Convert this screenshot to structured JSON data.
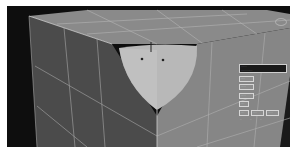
{
  "app": {
    "type": "3D modeling viewport",
    "view": "perspective"
  },
  "scene": {
    "object": "box with spherical cutout",
    "colors": {
      "background": "#0e0e0e",
      "top_face": "#8a8a8a",
      "right_face": "#868686",
      "left_face": "#4b4b4b",
      "cutout": "#b5b5b5",
      "grid_lines": "#b8b8b8",
      "border": "#ffffff"
    }
  },
  "panel": {
    "title_line1": "......",
    "title_line2": "............",
    "rows": [
      [
        "....."
      ],
      [
        "......"
      ],
      [
        "......"
      ],
      [
        "...."
      ],
      [
        "....",
        ".....",
        "......"
      ],
      [
        "..",
        "..",
        ".."
      ]
    ]
  },
  "viewcube": {
    "icon": "viewcube-icon"
  }
}
